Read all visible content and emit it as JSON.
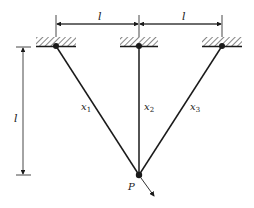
{
  "diagram": {
    "type": "three-bar truss / cable system",
    "dimension_labels": {
      "span_left": "l",
      "span_right": "l",
      "height": "l"
    },
    "members": [
      {
        "id": "x1",
        "label": "x",
        "sub": "1"
      },
      {
        "id": "x2",
        "label": "x",
        "sub": "2"
      },
      {
        "id": "x3",
        "label": "x",
        "sub": "3"
      }
    ],
    "load_point": {
      "label": "P"
    },
    "colors": {
      "line": "#1a1a1a",
      "hatch": "#333333"
    }
  }
}
